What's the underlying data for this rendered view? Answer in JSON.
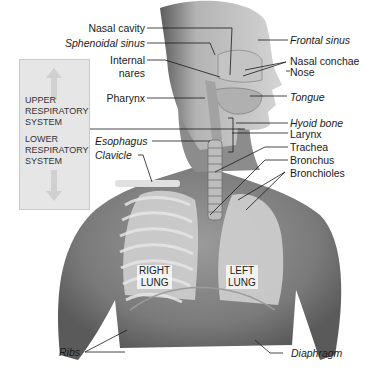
{
  "diagram": {
    "regions": {
      "upper": [
        "UPPER",
        "RESPIRATORY",
        "SYSTEM"
      ],
      "lower": [
        "LOWER",
        "RESPIRATORY",
        "SYSTEM"
      ]
    },
    "labels_left": {
      "nasal_cavity": "Nasal cavity",
      "sphenoidal_sinus": "Sphenoidal sinus",
      "internal_nares_1": "Internal",
      "internal_nares_2": "nares",
      "pharynx": "Pharynx",
      "esophagus": "Esophagus",
      "clavicle": "Clavicle",
      "ribs": "Ribs"
    },
    "labels_right": {
      "frontal_sinus": "Frontal sinus",
      "nasal_conchae": "Nasal conchae",
      "nose": "Nose",
      "tongue": "Tongue",
      "hyoid_bone": "Hyoid bone",
      "larynx": "Larynx",
      "trachea": "Trachea",
      "bronchus": "Bronchus",
      "bronchioles": "Bronchioles",
      "diaphragm": "Diaphragm"
    },
    "lungs": {
      "right": [
        "RIGHT",
        "LUNG"
      ],
      "left": [
        "LEFT",
        "LUNG"
      ]
    },
    "colors": {
      "skin_dark": "#6e6e6e",
      "skin_mid": "#8f8f8f",
      "lung": "#c8c8c8",
      "bone": "#e2e2e2",
      "box": "#e6e6e6",
      "line": "#1a1a1a"
    }
  }
}
